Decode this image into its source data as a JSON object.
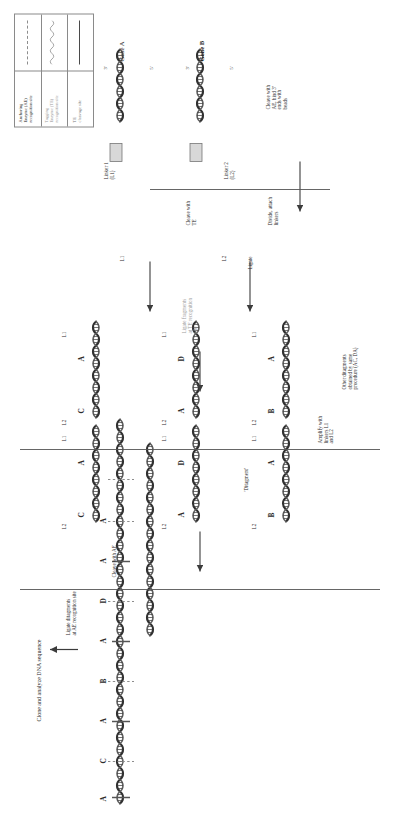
{
  "figure": {
    "title_note": "Clone and analyze DNA sequence",
    "orientation": "rotated-90"
  },
  "legend": {
    "rows": [
      {
        "label": "Anchoring\nEnzyme (AE)\nrecognition site",
        "style": "dashed",
        "color": "#8d8d8d"
      },
      {
        "label": "Tagging\nEnzyme (TE)\nrecognition site",
        "style": "squiggle",
        "color": "#9a9a9a"
      },
      {
        "label": "TE\ncleavage site",
        "style": "solid",
        "color": "#4a4a4a"
      }
    ]
  },
  "steps": {
    "clone_analyze": "Clone and analyze DNA sequence",
    "ligate_ditags": "Ligate ditagments\nat AE recognition site",
    "cleave_ae": "Cleave with AE",
    "amplify": "Amplify with\nlinkers L1\nand L2",
    "other_ditags": "Other ditagments\nobtained by same\nprocedure (AC, DA)",
    "ditagment": "'Ditagment'",
    "ligate_te": "Ligate fragments\nat TE recognition\nsite",
    "ligate": "Ligate",
    "cleave_te": "Cleave with\nTE",
    "divide_attach": "Divide, attach\nlinkers",
    "cleave_ae_beads": "Cleave with\nAE, bind 3'\nends with\nbeads",
    "linker1": "Linker 1\n(L1)",
    "linker2": "Linker 2\n(L2)"
  },
  "genes": {
    "a": "Gene A",
    "b": "Gene B"
  },
  "linkers": {
    "l1": "L1",
    "l2": "L2"
  },
  "tags": {
    "a": "A",
    "b": "B",
    "c": "C",
    "d": "D"
  },
  "final_sequence": [
    "A",
    "C",
    "A",
    "B",
    "A",
    "D",
    "A",
    "A"
  ],
  "colors": {
    "ae_site": "#8d8d8d",
    "te_site": "#9a9a9a",
    "te_cleavage": "#4a4a4a",
    "bead": "#d8d8d8",
    "bar": "#8e8e8e",
    "ink": "#2b2b2b"
  },
  "prime_marks": {
    "five": "5'",
    "three": "3'"
  }
}
